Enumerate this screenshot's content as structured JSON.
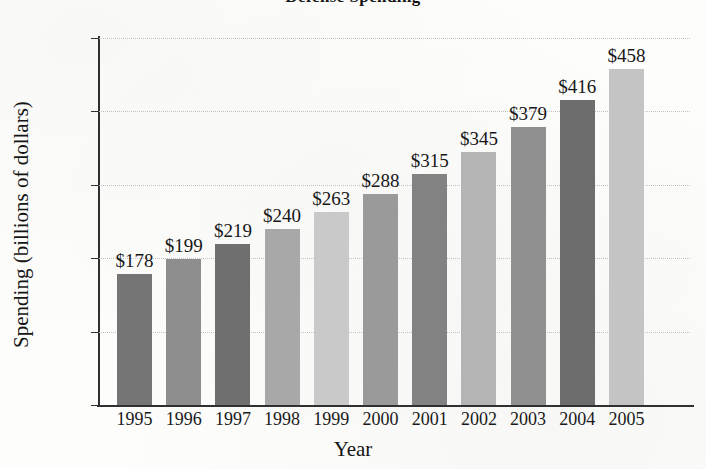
{
  "chart_data": {
    "type": "bar",
    "title": "Defense Spending",
    "xlabel": "Year",
    "ylabel": "Spending (billions of dollars)",
    "categories": [
      "1995",
      "1996",
      "1997",
      "1998",
      "1999",
      "2000",
      "2001",
      "2002",
      "2003",
      "2004",
      "2005"
    ],
    "values": [
      178,
      199,
      219,
      240,
      263,
      288,
      315,
      345,
      379,
      416,
      458
    ],
    "value_labels": [
      "$178",
      "$199",
      "$219",
      "$240",
      "$263",
      "$288",
      "$315",
      "$345",
      "$379",
      "$416",
      "$458"
    ],
    "bar_colors": [
      "#757575",
      "#8e8e8e",
      "#6f6f6f",
      "#a8a8a8",
      "#c9c9c9",
      "#9a9a9a",
      "#828282",
      "#b4b4b4",
      "#909090",
      "#6d6d6d",
      "#c4c4c4"
    ],
    "ylim": [
      0,
      500
    ],
    "ytick_values": [
      0,
      100,
      200,
      300,
      400,
      500
    ],
    "ytick_labels": [
      "0",
      "100",
      "200",
      "300",
      "400",
      "$500"
    ],
    "grid": true,
    "grid_style": "dotted",
    "legend": "none",
    "series_name": "Spending"
  }
}
